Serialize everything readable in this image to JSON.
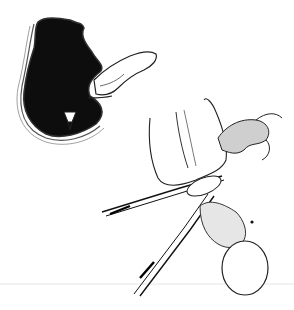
{
  "image": {
    "kind": "surgical line illustration",
    "width": 294,
    "height": 310,
    "background": "#ffffff",
    "ink": "#111111",
    "figures": [
      {
        "name": "sectioned-organ",
        "description": "cross-section of hollow organ with dark interior, finger inserted from right"
      },
      {
        "name": "hand-with-forceps",
        "description": "hand holding tissue with surgical forceps / clamp"
      },
      {
        "name": "inflated-sac",
        "description": "rounded balloon-like sac at lower right"
      }
    ]
  }
}
